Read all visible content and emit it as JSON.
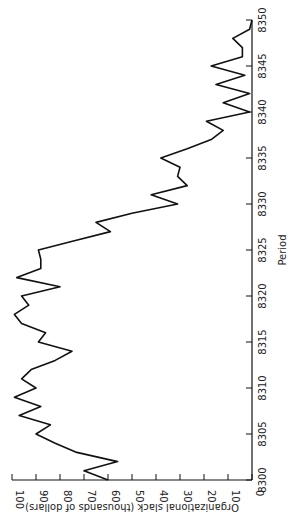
{
  "chart_data": {
    "type": "line",
    "orientation": "rotated-90",
    "xlabel": "Period",
    "ylabel": "Organizational slack (thousands of dollars)",
    "xlim": [
      8300,
      8350
    ],
    "ylim": [
      0,
      100
    ],
    "xticks": [
      8300,
      8305,
      8310,
      8315,
      8320,
      8325,
      8330,
      8335,
      8340,
      8345,
      8350
    ],
    "yticks": [
      0,
      10,
      20,
      30,
      40,
      50,
      60,
      70,
      80,
      90,
      100
    ],
    "grid": false,
    "x": [
      8300,
      8301,
      8302,
      8303,
      8304,
      8305,
      8306,
      8307,
      8308,
      8309,
      8310,
      8311,
      8312,
      8313,
      8314,
      8315,
      8316,
      8317,
      8318,
      8319,
      8320,
      8321,
      8322,
      8323,
      8324,
      8325,
      8326,
      8327,
      8328,
      8329,
      8330,
      8331,
      8332,
      8333,
      8334,
      8335,
      8336,
      8337,
      8338,
      8339,
      8340,
      8341,
      8342,
      8343,
      8344,
      8345,
      8346,
      8347,
      8348,
      8349,
      8350
    ],
    "series": [
      {
        "name": "Organizational slack",
        "values": [
          60,
          70,
          56,
          73,
          82,
          90,
          84,
          97,
          88,
          99,
          90,
          96,
          92,
          82,
          75,
          89,
          86,
          96,
          99,
          93,
          96,
          80,
          98,
          88,
          88,
          89,
          74,
          59,
          65,
          50,
          31,
          42,
          27,
          31,
          30,
          38,
          27,
          17,
          12,
          19,
          1,
          12,
          1,
          15,
          3,
          17,
          4,
          4,
          8,
          1,
          0
        ]
      }
    ]
  }
}
